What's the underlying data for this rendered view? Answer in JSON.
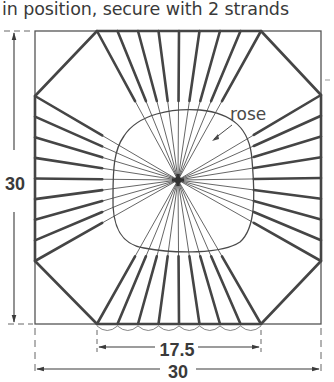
{
  "caption": "in position, secure with 2 strands",
  "labels": {
    "rose": "rose",
    "height": "30",
    "bottom_inner": "17.5",
    "bottom_outer": "30"
  },
  "geometry": {
    "square": {
      "x1": 35,
      "y1": 31,
      "x2": 321,
      "y2": 324
    },
    "center": [
      178,
      180
    ],
    "octagon": [
      [
        97,
        31
      ],
      [
        261,
        31
      ],
      [
        321,
        95
      ],
      [
        321,
        261
      ],
      [
        261,
        324
      ],
      [
        97,
        324
      ],
      [
        35,
        261
      ],
      [
        35,
        96
      ]
    ],
    "spokes_per_side": 9,
    "spoke_color": "#454545",
    "line_color": "#4a4a4a"
  }
}
